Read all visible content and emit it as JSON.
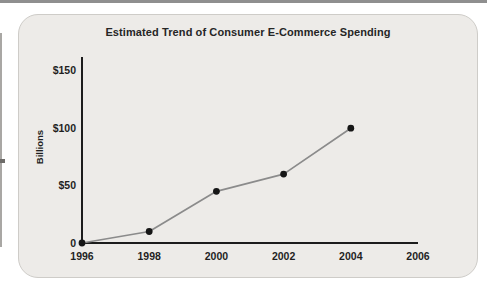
{
  "chart_data": {
    "type": "line",
    "title": "Estimated Trend of Consumer E-Commerce Spending",
    "xlabel": "",
    "ylabel": "Billions",
    "series": [
      {
        "name": "Consumer e-commerce spending",
        "x": [
          1996,
          1998,
          2000,
          2002,
          2004
        ],
        "values": [
          0,
          10,
          45,
          60,
          100
        ]
      }
    ],
    "xticks": [
      "1996",
      "1998",
      "2000",
      "2002",
      "2004",
      "2006"
    ],
    "xtick_values": [
      1996,
      1998,
      2000,
      2002,
      2004,
      2006
    ],
    "ytick_labels": [
      "0",
      "$50",
      "$100",
      "$150"
    ],
    "ytick_values": [
      0,
      50,
      100,
      150
    ],
    "xlim": [
      1996,
      2006
    ],
    "ylim": [
      0,
      162
    ],
    "grid": false,
    "legend": "none",
    "colors": {
      "line": "#8b8b8b",
      "marker": "#161616",
      "axis": "#1c1c1c"
    }
  }
}
